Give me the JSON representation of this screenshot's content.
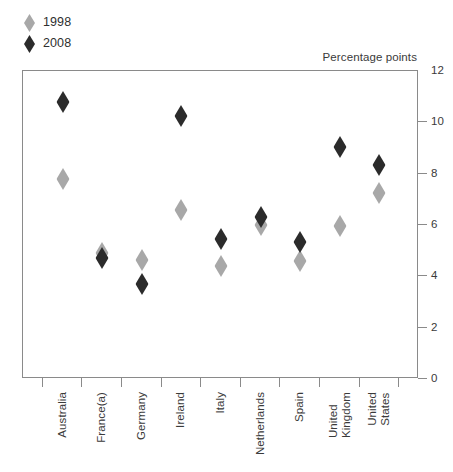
{
  "chart_data": {
    "type": "scatter",
    "title": "",
    "subtitle": "",
    "xlabel": "",
    "ylabel": "Percentage points",
    "ylim": [
      0,
      12
    ],
    "yticks": [
      0,
      2,
      4,
      6,
      8,
      10,
      12
    ],
    "grid": false,
    "legend_position": "top-left",
    "marker": "diamond",
    "categories": [
      "Australia",
      "France(a)",
      "Germany",
      "Ireland",
      "Italy",
      "Netherlands",
      "Spain",
      "United\nKingdom",
      "United\nStates"
    ],
    "series": [
      {
        "name": "1998",
        "color": "#a8a8a8",
        "values": [
          7.8,
          4.9,
          4.65,
          6.6,
          4.4,
          6.0,
          4.6,
          5.95,
          7.25
        ]
      },
      {
        "name": "2008",
        "color": "#2b2b2b",
        "values": [
          10.8,
          4.7,
          3.7,
          10.25,
          5.45,
          6.3,
          5.35,
          9.05,
          8.35
        ]
      }
    ]
  },
  "legend": {
    "items": [
      {
        "label": "1998",
        "color": "#a8a8a8"
      },
      {
        "label": "2008",
        "color": "#2b2b2b"
      }
    ]
  },
  "axis": {
    "y_title": "Percentage points",
    "y_tick_labels": [
      "12",
      "10",
      "8",
      "6",
      "4",
      "2",
      "0"
    ]
  },
  "colors": {
    "series_1998": "#a8a8a8",
    "series_2008": "#2b2b2b",
    "frame": "#8a8a8a",
    "text": "#3a3a3a",
    "background": "#ffffff"
  }
}
